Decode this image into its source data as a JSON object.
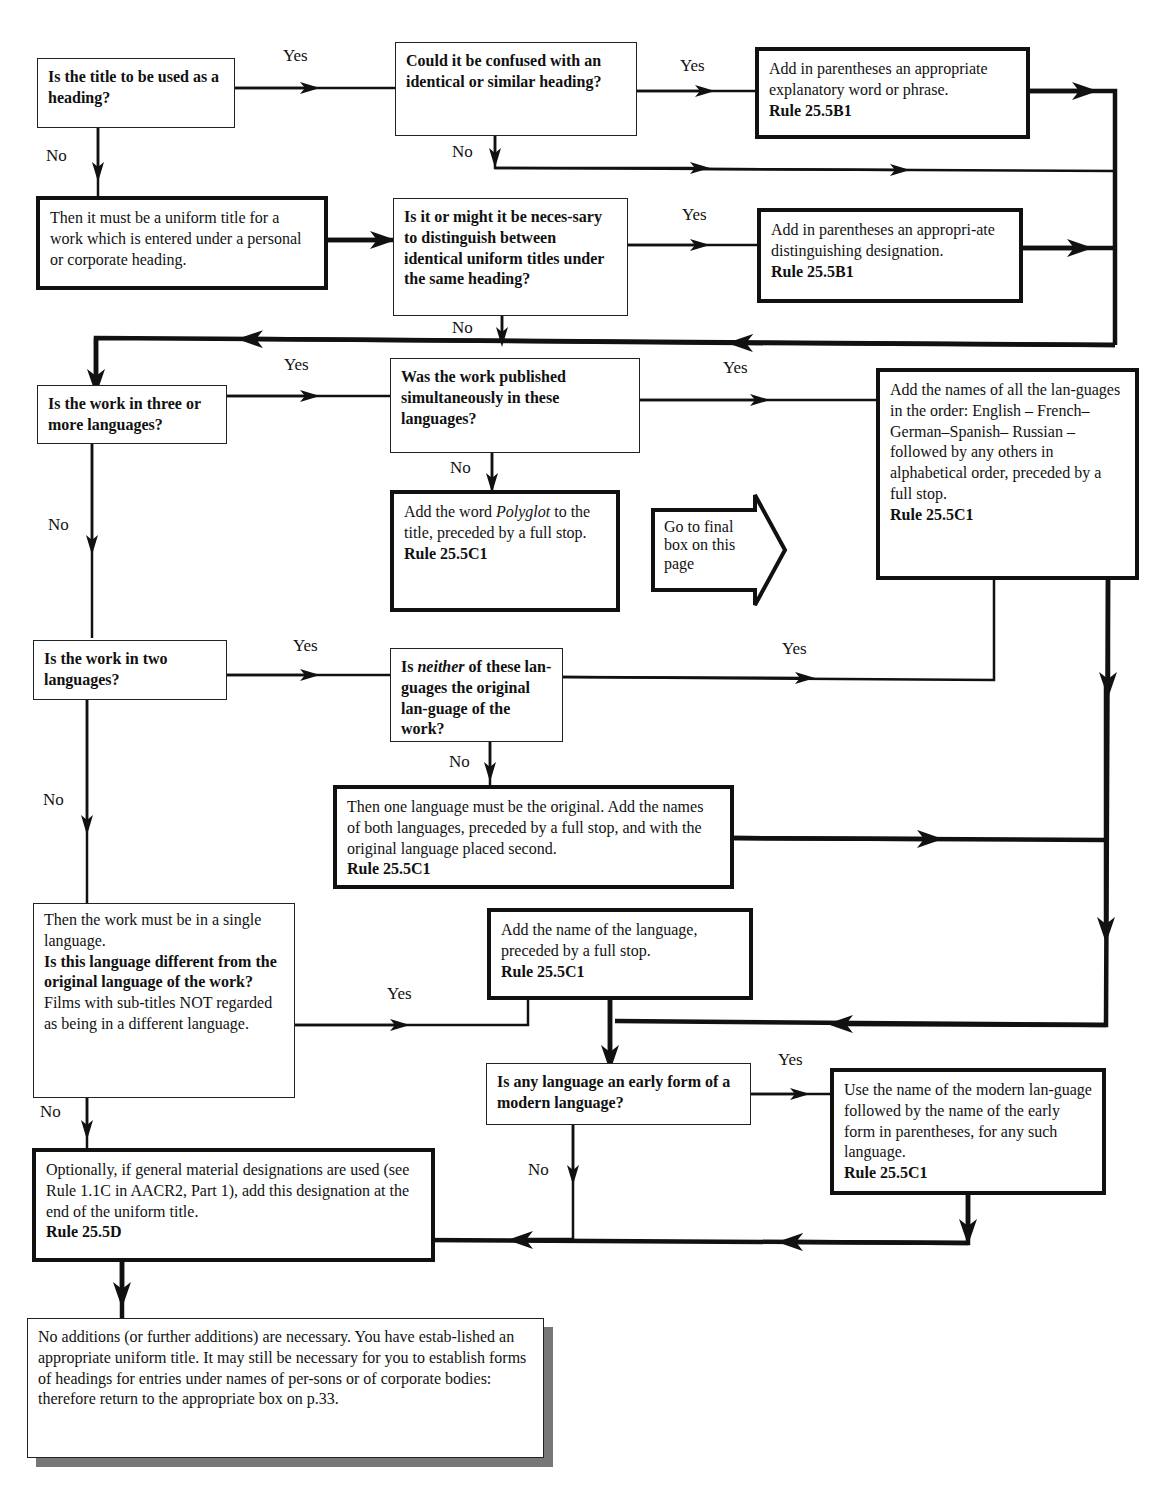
{
  "diagram": {
    "nodes": {
      "q_heading": {
        "text": "Is the title to be used as a heading?"
      },
      "q_confused": {
        "text": "Could it be confused with an identical or similar heading?"
      },
      "a_explanatory": {
        "text": "Add in parentheses an appropriate explanatory word or phrase.",
        "rule": "Rule 25.5B1"
      },
      "s_uniform": {
        "text": "Then it must be a uniform title for a work which is entered under a personal or corporate heading."
      },
      "q_distinguish": {
        "text": "Is it or might it be neces-sary to distinguish between identical uniform titles under the same heading?"
      },
      "a_distinguishing": {
        "text": "Add in parentheses an appropri-ate distinguishing designation.",
        "rule": "Rule 25.5B1"
      },
      "q_three": {
        "text": "Is the work in three or more languages?"
      },
      "q_simultaneous": {
        "text": "Was the work published simultaneously in these languages?"
      },
      "a_polyglot": {
        "pre": "Add the word ",
        "em": "Polyglot",
        "post": " to the title, preceded by a full stop.",
        "rule": "Rule 25.5C1"
      },
      "goto_final": {
        "text": "Go to final box on this page"
      },
      "a_all_names": {
        "text": "Add the names of all the lan-guages in the order: English – French–German–Spanish– Russian – followed by any others in alphabetical order, preceded by a full stop.",
        "rule": "Rule 25.5C1"
      },
      "q_two": {
        "text": "Is the work in two languages?"
      },
      "q_neither": {
        "pre": "Is ",
        "em": "neither",
        "post": " of these lan-guages the original lan-guage of the work?"
      },
      "a_both": {
        "text": "Then one language must be the original. Add the names of both languages, preceded by a full stop, and with the original language placed second.",
        "rule": "Rule 25.5C1"
      },
      "q_single": {
        "intro": "Then the work must be in a single language.",
        "question": "Is this language different from the original language of the work?",
        "note": "Films with sub-titles NOT regarded as being in a different language."
      },
      "a_name_lang": {
        "text": "Add the name of the language, preceded by a full stop.",
        "rule": "Rule 25.5C1"
      },
      "q_early": {
        "text": "Is any language an early form of a modern language?"
      },
      "a_modern": {
        "text": "Use the name of the modern lan-guage followed by the name of the early form in parentheses, for any such language.",
        "rule": "Rule 25.5C1"
      },
      "a_gmd": {
        "text": "Optionally, if general material designations are used (see Rule 1.1C in AACR2, Part 1), add this designation at the end of the uniform title.",
        "rule": "Rule 25.5D"
      },
      "final": {
        "text": "No additions (or further additions) are necessary. You have estab-lished an appropriate uniform title. It may still be necessary for you to establish forms of  headings for entries under names of per-sons or of corporate bodies: therefore return to the appropriate box on p.33."
      }
    },
    "labels": {
      "yes": "Yes",
      "no": "No"
    }
  }
}
